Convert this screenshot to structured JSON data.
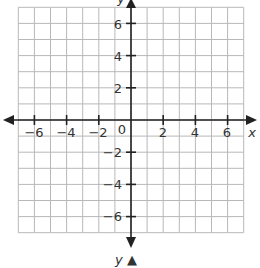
{
  "chart_data": {
    "type": "scatter",
    "title": "",
    "xlabel": "x",
    "ylabel": "y",
    "xlim": [
      -7,
      7
    ],
    "ylim": [
      -7,
      7
    ],
    "grid": true,
    "grid_step": 1,
    "x_ticks": [
      -6,
      -4,
      -2,
      2,
      4,
      6
    ],
    "y_ticks": [
      -6,
      -4,
      -2,
      2,
      4,
      6
    ],
    "origin_label": "0",
    "series": [],
    "annotations": [
      "y ▲"
    ]
  },
  "labels": {
    "x_axis": "x",
    "y_axis_top": "y",
    "y_axis_bottom": "y ▲",
    "origin": "0",
    "x_ticks": [
      "−6",
      "−4",
      "−2",
      "2",
      "4",
      "6"
    ],
    "y_ticks_pos": [
      "6",
      "4",
      "2"
    ],
    "y_ticks_neg": [
      "−2",
      "−4",
      "−6"
    ]
  },
  "colors": {
    "grid": "#b8b8b8",
    "axis": "#222222",
    "text": "#333333",
    "background": "#ffffff"
  }
}
